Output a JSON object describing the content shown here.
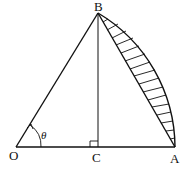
{
  "diagram": {
    "type": "geometry",
    "points": {
      "O": {
        "label": "O"
      },
      "A": {
        "label": "A"
      },
      "B": {
        "label": "B"
      },
      "C": {
        "label": "C"
      }
    },
    "angle_label": "θ",
    "right_angle_at": "C",
    "shaded_region": "circular segment between chord BA and arc BA",
    "colors": {
      "stroke": "#111111",
      "background": "#ffffff"
    }
  }
}
